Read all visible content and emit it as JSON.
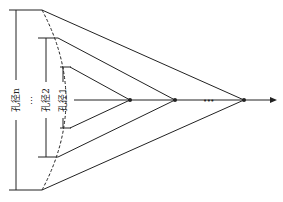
{
  "diagram": {
    "labels": {
      "aperture_n": "孔径n",
      "aperture_2": "孔径2",
      "aperture_1": "孔径1",
      "vertical_ellipsis": "⋮",
      "axis_ellipsis": "•••"
    },
    "colors": {
      "line": "#222222",
      "background": "#ffffff"
    },
    "apertures": [
      {
        "name": "aperture-1",
        "top_y": 67,
        "bottom_y": 128,
        "bracket_x": 63,
        "focus_x": 130
      },
      {
        "name": "aperture-2",
        "top_y": 38,
        "bottom_y": 157,
        "bracket_x": 46,
        "focus_x": 175
      },
      {
        "name": "aperture-n",
        "top_y": 10,
        "bottom_y": 190,
        "bracket_x": 16,
        "focus_x": 244
      }
    ],
    "axis": {
      "y": 100,
      "start_x": 74,
      "end_x": 276
    }
  }
}
